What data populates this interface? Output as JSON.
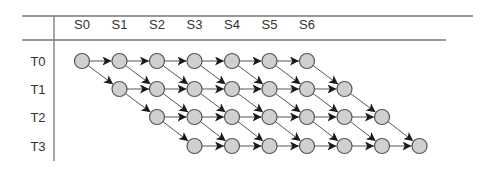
{
  "diagram": {
    "columns": [
      "S0",
      "S1",
      "S2",
      "S3",
      "S4",
      "S5",
      "S6"
    ],
    "rows": [
      {
        "label": "T0",
        "start_stage": 0,
        "node_count": 7
      },
      {
        "label": "T1",
        "start_stage": 1,
        "node_count": 7
      },
      {
        "label": "T2",
        "start_stage": 2,
        "node_count": 7
      },
      {
        "label": "T3",
        "start_stage": 3,
        "node_count": 7
      }
    ],
    "edges": {
      "horizontal": "each node points to the next node in the same row",
      "diagonal": "each node points to the node one row down and one step right"
    },
    "colors": {
      "node_fill": "#d0d0d0",
      "node_stroke": "#555555",
      "edge": "#555555",
      "arrowhead": "#1a1a1a",
      "rule": "#777777",
      "text": "#333333"
    }
  }
}
